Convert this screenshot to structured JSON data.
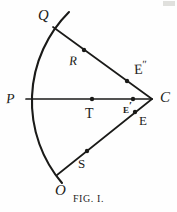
{
  "figure": {
    "caption": "FIG. I.",
    "ink_color": "#1a1a18",
    "background_color": "#fefefe",
    "width": 177,
    "height": 212
  },
  "labels": {
    "arc_top": "Q",
    "ray_upper_mid": "R",
    "ray_upper_near": "E",
    "ray_upper_near_primes": "″",
    "arc_left": "P",
    "axis_mid": "T",
    "axis_near": "E",
    "axis_near_primes": "′",
    "vertex": "C",
    "ray_lower_near": "E",
    "ray_lower_mid": "S",
    "arc_bottom": "O"
  },
  "geometry": {
    "vertex_point": {
      "name": "C",
      "x": 152,
      "y": 99
    },
    "arc": {
      "description": "circular arc centered at C passing through P",
      "center_x": 152,
      "center_y": 99,
      "radius": 126,
      "start_x": 69,
      "start_y": 12,
      "end_x": 62,
      "end_y": 183
    },
    "rays": [
      {
        "name": "ray-C-Q",
        "x1": 152,
        "y1": 99,
        "x2": 53,
        "y2": 27
      },
      {
        "name": "ray-C-P",
        "x1": 152,
        "y1": 99,
        "x2": 26,
        "y2": 99
      },
      {
        "name": "ray-C-O",
        "x1": 152,
        "y1": 99,
        "x2": 57,
        "y2": 175
      }
    ],
    "points": [
      {
        "name": "R",
        "x": 84,
        "y": 50
      },
      {
        "name": "E2",
        "x": 127,
        "y": 81
      },
      {
        "name": "T",
        "x": 92,
        "y": 99
      },
      {
        "name": "E1",
        "x": 133,
        "y": 99
      },
      {
        "name": "E",
        "x": 135,
        "y": 112
      },
      {
        "name": "S",
        "x": 87,
        "y": 151
      }
    ]
  }
}
